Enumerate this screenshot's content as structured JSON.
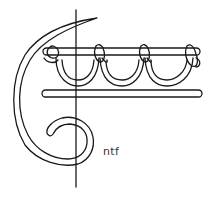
{
  "diagram": {
    "type": "stitch-illustration",
    "label": "ntf",
    "stroke_color": "#1a1a1a",
    "background": "#ffffff",
    "elements": [
      "vertical-guide-line",
      "curved-needle-thread",
      "upper-bar",
      "lower-bar",
      "loop-1",
      "loop-2",
      "loop-3"
    ]
  }
}
